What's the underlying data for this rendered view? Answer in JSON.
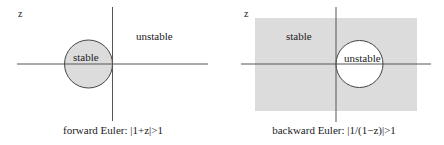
{
  "colors": {
    "background": "#ffffff",
    "region_fill": "#dcdcdc",
    "axis_stroke": "#555555",
    "circle_stroke": "#444444",
    "text": "#222222"
  },
  "panels": [
    {
      "id": "forward-euler",
      "plane_label": "z",
      "inside_label": "stable",
      "outside_label": "unstable",
      "caption": "forward Euler: |1+z|>1",
      "shaded_region": "inside-circle",
      "circle_center": "(-1, 0)",
      "circle_radius": 1
    },
    {
      "id": "backward-euler",
      "plane_label": "z",
      "inside_label": "unstable",
      "outside_label": "stable",
      "caption": "backward Euler: |1/(1−z)|>1",
      "shaded_region": "outside-circle",
      "circle_center": "(1, 0)",
      "circle_radius": 1
    }
  ]
}
